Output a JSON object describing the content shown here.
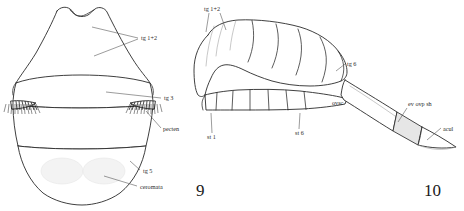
{
  "plate": {
    "width": 464,
    "height": 211,
    "background": "#ffffff",
    "ink_color": "#2a2a2a",
    "shading_color": "#e6e6e6"
  },
  "figures": [
    {
      "number": "9",
      "view": "dorsal",
      "subject": "metasoma",
      "number_x": 196,
      "number_y": 196,
      "labels": [
        {
          "id": "tg-1-2",
          "text": "tg 1+2",
          "x": 141,
          "y": 38
        },
        {
          "id": "tg-3",
          "text": "tg 3",
          "x": 164,
          "y": 99
        },
        {
          "id": "pecten",
          "text": "pecten",
          "x": 163,
          "y": 130
        },
        {
          "id": "tg-5",
          "text": "tg 5",
          "x": 143,
          "y": 172
        },
        {
          "id": "ceromata",
          "text": "ceromata",
          "x": 140,
          "y": 188
        }
      ]
    },
    {
      "number": "10",
      "view": "lateral",
      "subject": "metasoma with everted ovipositor",
      "number_x": 424,
      "number_y": 196,
      "labels": [
        {
          "id": "tg-1-2",
          "text": "tg 1+2",
          "x": 206,
          "y": 10
        },
        {
          "id": "tg-6",
          "text": "tg 6",
          "x": 347,
          "y": 65
        },
        {
          "id": "ovsc",
          "text": "ovsc",
          "x": 332,
          "y": 104
        },
        {
          "id": "st-1",
          "text": "st 1",
          "x": 210,
          "y": 135
        },
        {
          "id": "st-6",
          "text": "st 6",
          "x": 297,
          "y": 131
        },
        {
          "id": "ev-ovp-sh",
          "text": "ev ovp sh",
          "x": 408,
          "y": 105
        },
        {
          "id": "acul",
          "text": "acul",
          "x": 443,
          "y": 130
        }
      ]
    }
  ],
  "legend_terms": {
    "tg": "tergite",
    "st": "sternite",
    "pecten": "pecten",
    "ceromata": "ceromata",
    "ovsc": "ovipositor sheath base",
    "ev_ovp_sh": "everted ovipositor sheath",
    "acul": "aculeus"
  }
}
